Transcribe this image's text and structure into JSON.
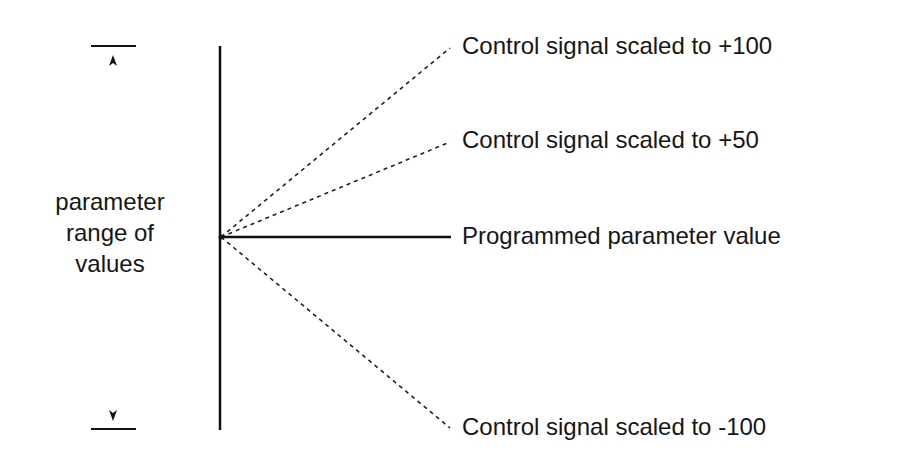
{
  "diagram": {
    "range_label_lines": [
      "parameter",
      "range of",
      "values"
    ],
    "lines": [
      {
        "id": "plus100",
        "label": "Control signal scaled to +100",
        "style": "dashed"
      },
      {
        "id": "plus50",
        "label": "Control signal scaled to +50",
        "style": "dashed"
      },
      {
        "id": "programmed",
        "label": "Programmed parameter value",
        "style": "solid"
      },
      {
        "id": "minus100",
        "label": "Control signal scaled to -100",
        "style": "dashed"
      }
    ],
    "range_markers": {
      "top": "upper-limit-arrow",
      "bottom": "lower-limit-arrow"
    },
    "colors": {
      "line": "#111111",
      "background": "#ffffff"
    }
  }
}
